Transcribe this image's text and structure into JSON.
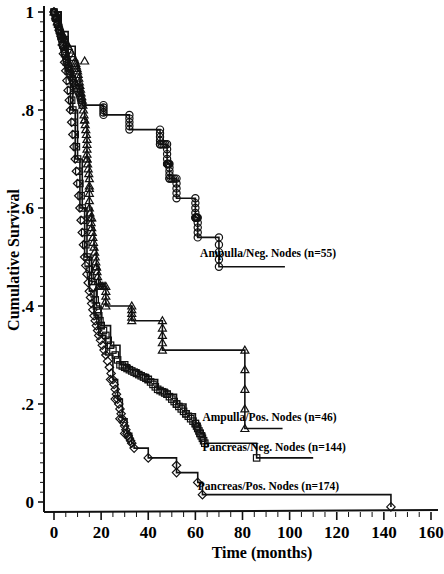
{
  "chart_data": {
    "type": "line",
    "subtype": "kaplan-meier-step",
    "title": "",
    "xlabel": "Time (months)",
    "ylabel": "Cumulative Survival",
    "xlim": [
      0,
      160
    ],
    "ylim": [
      0,
      1
    ],
    "x_ticks": [
      0,
      20,
      40,
      60,
      80,
      100,
      120,
      140,
      160
    ],
    "y_ticks": [
      0,
      0.2,
      0.4,
      0.6,
      0.8,
      1
    ],
    "y_tick_labels": [
      "0",
      ".2",
      ".4",
      ".6",
      ".8",
      "1"
    ],
    "grid": false,
    "series": [
      {
        "name": "Ampulla/Neg. Nodes (n=55)",
        "marker": "circle",
        "label_pos": [
          62,
          0.5
        ],
        "points": [
          [
            0,
            1.0
          ],
          [
            1,
            0.99
          ],
          [
            2,
            0.97
          ],
          [
            3,
            0.95
          ],
          [
            4,
            0.93
          ],
          [
            5,
            0.91
          ],
          [
            6,
            0.89
          ],
          [
            7,
            0.87
          ],
          [
            9,
            0.85
          ],
          [
            11,
            0.83
          ],
          [
            12,
            0.81
          ],
          [
            21,
            0.81
          ],
          [
            21,
            0.79
          ],
          [
            32,
            0.79
          ],
          [
            32,
            0.76
          ],
          [
            45,
            0.76
          ],
          [
            45,
            0.73
          ],
          [
            48,
            0.73
          ],
          [
            48,
            0.69
          ],
          [
            49,
            0.69
          ],
          [
            49,
            0.66
          ],
          [
            52,
            0.66
          ],
          [
            52,
            0.62
          ],
          [
            60,
            0.62
          ],
          [
            60,
            0.58
          ],
          [
            61,
            0.58
          ],
          [
            61,
            0.54
          ],
          [
            70,
            0.54
          ],
          [
            70,
            0.48
          ],
          [
            98,
            0.48
          ]
        ],
        "censored": [
          [
            0,
            1.0
          ],
          [
            12,
            0.81
          ],
          [
            21,
            0.79
          ],
          [
            32,
            0.76
          ],
          [
            45,
            0.73
          ],
          [
            48,
            0.69
          ],
          [
            49,
            0.66
          ],
          [
            52,
            0.62
          ],
          [
            60,
            0.58
          ],
          [
            61,
            0.54
          ],
          [
            70,
            0.48
          ]
        ]
      },
      {
        "name": "Ampulla/Pos. Nodes (n=46)",
        "marker": "triangle",
        "label_pos": [
          63,
          0.165
        ],
        "points": [
          [
            0,
            1.0
          ],
          [
            3,
            0.96
          ],
          [
            6,
            0.93
          ],
          [
            9,
            0.9
          ],
          [
            10,
            0.88
          ],
          [
            11,
            0.85
          ],
          [
            12,
            0.82
          ],
          [
            13,
            0.78
          ],
          [
            14,
            0.74
          ],
          [
            14,
            0.7
          ],
          [
            15,
            0.66
          ],
          [
            15,
            0.6
          ],
          [
            16,
            0.56
          ],
          [
            17,
            0.52
          ],
          [
            18,
            0.48
          ],
          [
            19,
            0.44
          ],
          [
            22,
            0.44
          ],
          [
            22,
            0.4
          ],
          [
            33,
            0.4
          ],
          [
            33,
            0.37
          ],
          [
            46,
            0.37
          ],
          [
            46,
            0.31
          ],
          [
            81,
            0.31
          ],
          [
            81,
            0.15
          ],
          [
            97,
            0.15
          ]
        ],
        "censored": [
          [
            13,
            0.9
          ],
          [
            13,
            0.78
          ],
          [
            14,
            0.7
          ],
          [
            15,
            0.64
          ],
          [
            16,
            0.58
          ],
          [
            18,
            0.48
          ],
          [
            19,
            0.44
          ],
          [
            22,
            0.4
          ],
          [
            33,
            0.37
          ],
          [
            46,
            0.31
          ],
          [
            81,
            0.15
          ]
        ]
      },
      {
        "name": "Pancreas/Neg. Nodes (n=144)",
        "marker": "square",
        "label_pos": [
          63,
          0.105
        ],
        "points": [
          [
            0,
            1.0
          ],
          [
            3,
            0.95
          ],
          [
            6,
            0.88
          ],
          [
            8,
            0.8
          ],
          [
            10,
            0.7
          ],
          [
            12,
            0.6
          ],
          [
            14,
            0.5
          ],
          [
            16,
            0.45
          ],
          [
            18,
            0.4
          ],
          [
            20,
            0.36
          ],
          [
            24,
            0.32
          ],
          [
            28,
            0.28
          ],
          [
            32,
            0.27
          ],
          [
            36,
            0.26
          ],
          [
            40,
            0.25
          ],
          [
            44,
            0.23
          ],
          [
            48,
            0.22
          ],
          [
            52,
            0.2
          ],
          [
            56,
            0.18
          ],
          [
            60,
            0.16
          ],
          [
            62,
            0.14
          ],
          [
            64,
            0.12
          ],
          [
            86,
            0.12
          ],
          [
            86,
            0.09
          ],
          [
            110,
            0.09
          ]
        ],
        "censored": [
          [
            20,
            0.36
          ],
          [
            30,
            0.28
          ],
          [
            40,
            0.25
          ],
          [
            48,
            0.22
          ],
          [
            52,
            0.2
          ],
          [
            56,
            0.18
          ],
          [
            60,
            0.16
          ],
          [
            62,
            0.14
          ],
          [
            64,
            0.12
          ],
          [
            86,
            0.09
          ]
        ]
      },
      {
        "name": "Pancreas/Pos. Nodes (n=174)",
        "marker": "diamond",
        "label_pos": [
          61,
          0.025
        ],
        "points": [
          [
            0,
            1.0
          ],
          [
            3,
            0.95
          ],
          [
            5,
            0.88
          ],
          [
            7,
            0.8
          ],
          [
            9,
            0.7
          ],
          [
            11,
            0.6
          ],
          [
            13,
            0.5
          ],
          [
            15,
            0.43
          ],
          [
            17,
            0.38
          ],
          [
            19,
            0.34
          ],
          [
            22,
            0.3
          ],
          [
            25,
            0.25
          ],
          [
            27,
            0.21
          ],
          [
            29,
            0.17
          ],
          [
            31,
            0.14
          ],
          [
            33,
            0.12
          ],
          [
            34,
            0.11
          ],
          [
            40,
            0.11
          ],
          [
            40,
            0.09
          ],
          [
            52,
            0.09
          ],
          [
            52,
            0.06
          ],
          [
            61,
            0.06
          ],
          [
            61,
            0.04
          ],
          [
            63,
            0.04
          ],
          [
            63,
            0.015
          ],
          [
            143,
            0.015
          ],
          [
            143,
            -0.01
          ]
        ],
        "censored": [
          [
            24,
            0.25
          ],
          [
            26,
            0.21
          ],
          [
            28,
            0.17
          ],
          [
            30,
            0.14
          ],
          [
            33,
            0.12
          ],
          [
            34,
            0.11
          ],
          [
            40,
            0.09
          ],
          [
            52,
            0.075
          ],
          [
            52,
            0.06
          ],
          [
            61,
            0.04
          ],
          [
            63,
            0.015
          ],
          [
            143,
            -0.01
          ]
        ]
      }
    ]
  }
}
